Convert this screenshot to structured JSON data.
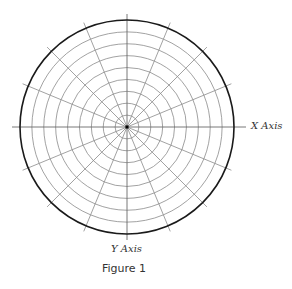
{
  "figure": {
    "caption": "Figure 1",
    "x_axis_label": "X Axis",
    "y_axis_label": "Y Axis"
  },
  "grid": {
    "type": "polar",
    "center": [
      127,
      127
    ],
    "outer_radius": 107,
    "ring_count": 9,
    "ring_spacing": 11.9,
    "spoke_count": 16,
    "spoke_angle_step_deg": 22.5,
    "spoke_overshoot": 6,
    "axis_overshoot": 12,
    "colors": {
      "grid_line": "#8a8a8a",
      "outer_circle": "#1a1a1a",
      "axis_line": "#6a6a6a",
      "center_dot": "#000000"
    }
  }
}
